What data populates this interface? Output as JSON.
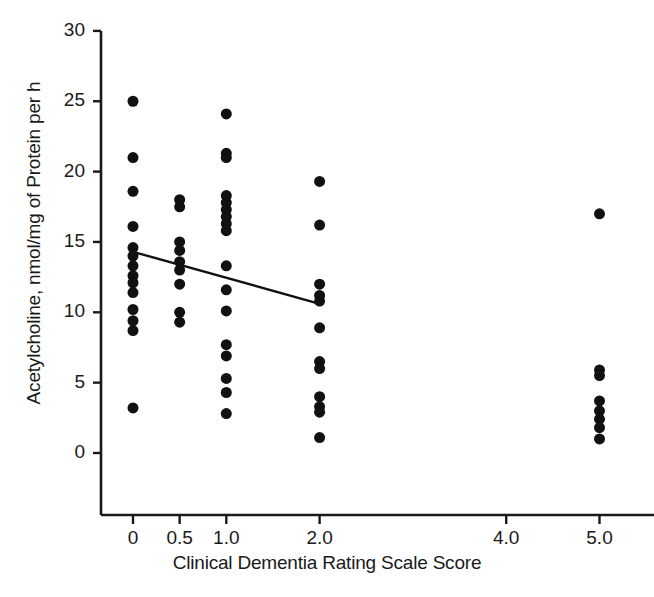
{
  "chart_data": {
    "type": "scatter",
    "title": "",
    "xlabel": "Clinical Dementia Rating Scale Score",
    "ylabel": "Acetylcholine, nmol/mg of Protein per h",
    "xlim": [
      -0.35,
      5.6
    ],
    "ylim": [
      -3.0,
      30.0
    ],
    "grid": false,
    "legend": null,
    "xticks": [
      0,
      0.5,
      1.0,
      2.0,
      4.0,
      5.0
    ],
    "xticklabels": [
      "0",
      "0.5",
      "1.0",
      "2.0",
      "4.0",
      "5.0"
    ],
    "yticks": [
      0,
      5,
      10,
      15,
      20,
      25,
      30
    ],
    "yticklabels": [
      "0",
      "5",
      "10",
      "15",
      "20",
      "25",
      "30"
    ],
    "marker": "filled-circle",
    "marker_color": "#111111",
    "marker_size_px": 11,
    "axis_color": "#1a1a1a",
    "series": [
      {
        "name": "Acetylcholine synthesis",
        "points": [
          {
            "x": 0.0,
            "y": 25.0
          },
          {
            "x": 0.0,
            "y": 21.0
          },
          {
            "x": 0.0,
            "y": 18.6
          },
          {
            "x": 0.0,
            "y": 16.1
          },
          {
            "x": 0.0,
            "y": 14.6
          },
          {
            "x": 0.0,
            "y": 14.0
          },
          {
            "x": 0.0,
            "y": 13.3
          },
          {
            "x": 0.0,
            "y": 12.6
          },
          {
            "x": 0.0,
            "y": 12.1
          },
          {
            "x": 0.0,
            "y": 11.4
          },
          {
            "x": 0.0,
            "y": 10.2
          },
          {
            "x": 0.0,
            "y": 9.4
          },
          {
            "x": 0.0,
            "y": 8.7
          },
          {
            "x": 0.0,
            "y": 3.2
          },
          {
            "x": 0.5,
            "y": 18.0
          },
          {
            "x": 0.5,
            "y": 17.5
          },
          {
            "x": 0.5,
            "y": 15.0
          },
          {
            "x": 0.5,
            "y": 14.4
          },
          {
            "x": 0.5,
            "y": 13.6
          },
          {
            "x": 0.5,
            "y": 13.0
          },
          {
            "x": 0.5,
            "y": 12.0
          },
          {
            "x": 0.5,
            "y": 10.0
          },
          {
            "x": 0.5,
            "y": 9.3
          },
          {
            "x": 1.0,
            "y": 24.1
          },
          {
            "x": 1.0,
            "y": 21.3
          },
          {
            "x": 1.0,
            "y": 21.0
          },
          {
            "x": 1.0,
            "y": 18.3
          },
          {
            "x": 1.0,
            "y": 17.8
          },
          {
            "x": 1.0,
            "y": 17.3
          },
          {
            "x": 1.0,
            "y": 16.8
          },
          {
            "x": 1.0,
            "y": 16.3
          },
          {
            "x": 1.0,
            "y": 15.8
          },
          {
            "x": 1.0,
            "y": 13.3
          },
          {
            "x": 1.0,
            "y": 11.6
          },
          {
            "x": 1.0,
            "y": 10.1
          },
          {
            "x": 1.0,
            "y": 7.7
          },
          {
            "x": 1.0,
            "y": 6.9
          },
          {
            "x": 1.0,
            "y": 5.3
          },
          {
            "x": 1.0,
            "y": 4.3
          },
          {
            "x": 1.0,
            "y": 2.8
          },
          {
            "x": 2.0,
            "y": 19.3
          },
          {
            "x": 2.0,
            "y": 16.2
          },
          {
            "x": 2.0,
            "y": 12.0
          },
          {
            "x": 2.0,
            "y": 11.2
          },
          {
            "x": 2.0,
            "y": 10.8
          },
          {
            "x": 2.0,
            "y": 8.9
          },
          {
            "x": 2.0,
            "y": 6.5
          },
          {
            "x": 2.0,
            "y": 6.0
          },
          {
            "x": 2.0,
            "y": 4.0
          },
          {
            "x": 2.0,
            "y": 3.3
          },
          {
            "x": 2.0,
            "y": 2.9
          },
          {
            "x": 2.0,
            "y": 1.1
          },
          {
            "x": 5.0,
            "y": 17.0
          },
          {
            "x": 5.0,
            "y": 5.9
          },
          {
            "x": 5.0,
            "y": 5.5
          },
          {
            "x": 5.0,
            "y": 3.7
          },
          {
            "x": 5.0,
            "y": 3.0
          },
          {
            "x": 5.0,
            "y": 2.4
          },
          {
            "x": 5.0,
            "y": 1.8
          },
          {
            "x": 5.0,
            "y": 1.0
          }
        ]
      }
    ],
    "trendline": {
      "name": "regression-line",
      "x0": 0.0,
      "y0": 14.3,
      "x1": 2.0,
      "y1": 10.6,
      "color": "#111111",
      "width_px": 2.4
    }
  }
}
